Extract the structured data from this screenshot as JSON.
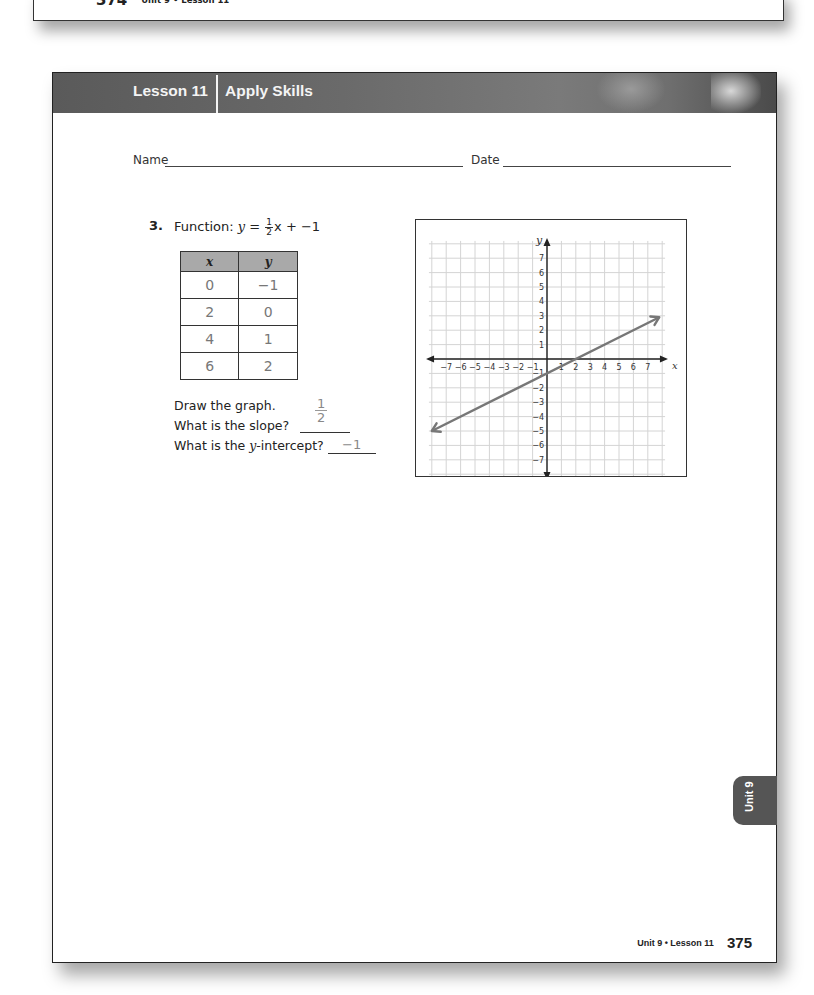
{
  "top_page": {
    "page_number": "374",
    "footer_label": "Unit 9 • Lesson 11"
  },
  "header": {
    "lesson": "Lesson 11",
    "title": "Apply Skills"
  },
  "form": {
    "name_label": "Name",
    "date_label": "Date"
  },
  "question": {
    "number": "3.",
    "prefix": "Function: ",
    "y_var": "y",
    "equals": " = ",
    "coef_num": "1",
    "coef_den": "2",
    "suffix": "x + −1",
    "table": {
      "headers": [
        "x",
        "y"
      ],
      "rows": [
        [
          "0",
          "−1"
        ],
        [
          "2",
          "0"
        ],
        [
          "4",
          "1"
        ],
        [
          "6",
          "2"
        ]
      ]
    },
    "draw_prompt": "Draw the graph.",
    "slope_prompt": "What is the slope?",
    "slope_answer_num": "1",
    "slope_answer_den": "2",
    "yint_prompt_a": "What is the ",
    "yint_prompt_var": "y",
    "yint_prompt_b": "-intercept?",
    "yint_answer": "−1"
  },
  "chart_data": {
    "type": "line",
    "title": "",
    "xlabel": "x",
    "ylabel": "y",
    "xlim": [
      -7,
      7
    ],
    "ylim": [
      -7,
      7
    ],
    "grid": true,
    "x_ticks": [
      "−7",
      "−6",
      "−5",
      "−4",
      "−3",
      "−2",
      "−1",
      "1",
      "2",
      "3",
      "4",
      "5",
      "6",
      "7"
    ],
    "y_ticks": [
      "7",
      "6",
      "5",
      "4",
      "3",
      "2",
      "1",
      "−1",
      "−2",
      "−3",
      "−4",
      "−5",
      "−6",
      "−7"
    ],
    "series": [
      {
        "name": "y = 1/2 x + −1",
        "slope": 0.5,
        "intercept": -1,
        "x": [
          -8,
          7.8
        ],
        "y": [
          -5,
          2.9
        ],
        "arrows": "both"
      }
    ]
  },
  "side_tab": {
    "label": "Unit 9"
  },
  "footer": {
    "label": "Unit 9 • Lesson 11",
    "page_number": "375"
  }
}
